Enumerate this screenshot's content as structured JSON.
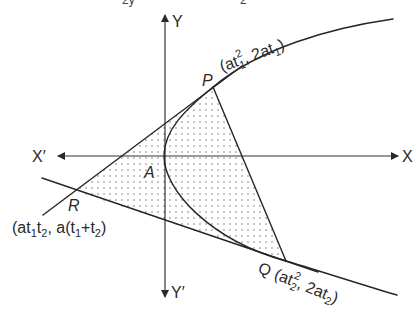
{
  "diagram": {
    "title_fragments": [
      "2y",
      "2"
    ],
    "axes": {
      "x_pos_label": "X",
      "x_neg_label": "X′",
      "y_pos_label": "Y",
      "y_neg_label": "Y′"
    },
    "vertex_label": "A",
    "points": {
      "P": {
        "name": "P",
        "coord_prefix": "(at",
        "coord_sub1": "1",
        "coord_sup": "2",
        "coord_mid": ", 2at",
        "coord_sub2": "1",
        "coord_suffix": ")"
      },
      "Q": {
        "name": "Q",
        "coord_prefix": "(at",
        "coord_sub1": "2",
        "coord_sup": "2",
        "coord_mid": ", 2at",
        "coord_sub2": "2",
        "coord_suffix": ")"
      },
      "R": {
        "name": "R",
        "coord_a": "(at",
        "coord_sub1": "1",
        "coord_t": "t",
        "coord_sub2": "2",
        "coord_mid": ", a(t",
        "coord_sub3": "1",
        "coord_plus": "+t",
        "coord_sub4": "2",
        "coord_suffix": ")"
      }
    },
    "colors": {
      "ink": "#262626",
      "shade_dot": "#6a6a6a",
      "background": "#ffffff"
    }
  }
}
